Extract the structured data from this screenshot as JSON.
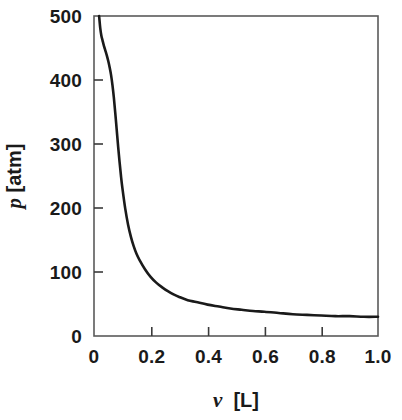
{
  "chart_data": {
    "type": "line",
    "title": "",
    "subtitle": "",
    "xlabel_symbol": "v",
    "xlabel_unit": "[L]",
    "xlabel": "v [L]",
    "ylabel_symbol": "p",
    "ylabel_unit": "[atm]",
    "ylabel": "p [atm]",
    "xlim": [
      0,
      1.0
    ],
    "ylim": [
      0,
      500
    ],
    "xticks": [
      0,
      0.2,
      0.4,
      0.6,
      0.8,
      1.0
    ],
    "xtick_labels": [
      "0",
      "0.2",
      "0.4",
      "0.6",
      "0.8",
      "1.0"
    ],
    "yticks": [
      0,
      100,
      200,
      300,
      400,
      500
    ],
    "ytick_labels": [
      "0",
      "100",
      "200",
      "300",
      "400",
      "500"
    ],
    "grid": false,
    "legend": null,
    "legend_position": "none",
    "tick_direction": "in",
    "frame": "box",
    "series": [
      {
        "name": "isotherm",
        "color": "#1a1a1a",
        "line_width": 2.6,
        "x": [
          0.018,
          0.022,
          0.026,
          0.03,
          0.034,
          0.038,
          0.042,
          0.046,
          0.05,
          0.055,
          0.06,
          0.065,
          0.07,
          0.075,
          0.08,
          0.085,
          0.09,
          0.095,
          0.1,
          0.11,
          0.12,
          0.13,
          0.14,
          0.15,
          0.16,
          0.18,
          0.2,
          0.22,
          0.24,
          0.26,
          0.28,
          0.3,
          0.33,
          0.36,
          0.4,
          0.44,
          0.48,
          0.52,
          0.56,
          0.6,
          0.65,
          0.7,
          0.75,
          0.8,
          0.85,
          0.9,
          0.95,
          1.0
        ],
        "y": [
          500,
          481,
          469,
          462,
          455,
          449,
          443,
          437,
          430,
          420,
          408,
          392,
          372,
          348,
          322,
          296,
          272,
          250,
          231,
          199,
          174,
          155,
          140,
          128,
          119,
          104,
          92,
          83,
          76,
          70,
          65,
          61,
          56,
          53,
          49,
          46,
          43,
          41,
          39,
          38,
          36,
          34,
          33,
          32,
          31,
          31,
          30,
          30
        ]
      }
    ],
    "annotations": []
  },
  "axes": {
    "y_tick_labels": [
      "500",
      "400",
      "300",
      "200",
      "100",
      "0"
    ],
    "x_tick_labels": [
      "0",
      "0.2",
      "0.4",
      "0.6",
      "0.8",
      "1.0"
    ],
    "x_title_symbol": "v",
    "x_title_unit": "[L]",
    "y_title_symbol": "p",
    "y_title_unit": "[atm]"
  },
  "colors": {
    "background": "#ffffff",
    "axis": "#4a4a4a",
    "curve": "#1a1a1a",
    "text": "#1a1a1a"
  }
}
